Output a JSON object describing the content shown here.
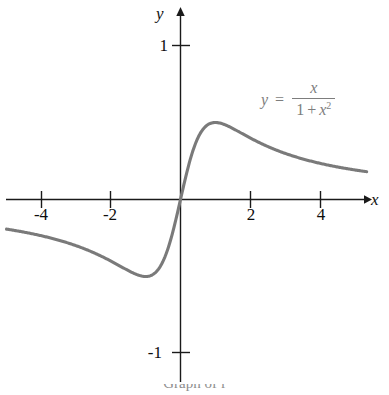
{
  "figure": {
    "background_color": "#ffffff",
    "curve_color": "#7a7a7a",
    "axis_color": "#1a1a1a",
    "label_color": "#0d0d0d",
    "equation_color": "#7d7d7d"
  },
  "axes": {
    "x_name": "x",
    "y_name": "y"
  },
  "equation": {
    "lhs": "y",
    "equals": "=",
    "numerator": "x",
    "denominator_one": "1",
    "denominator_plus": "+",
    "denominator_var": "x",
    "denominator_exp": "2",
    "plain": "y = x / (1 + x^2)"
  },
  "caption": {
    "text": "Graph of f "
  },
  "chart_data": {
    "type": "line",
    "title": "",
    "subtitle": "",
    "xlabel": "x",
    "ylabel": "y",
    "function": "y = x/(1 + x^2)",
    "legend": [
      "y = x/(1 + x^2)"
    ],
    "legend_position": "upper-right-inside",
    "grid": false,
    "xlim": [
      -5.0,
      5.35
    ],
    "ylim": [
      -1.3,
      1.26
    ],
    "xticks": [
      -4,
      -2,
      2,
      4
    ],
    "xtick_labels": [
      "-4",
      "-2",
      "2",
      "4"
    ],
    "yticks": [
      1,
      -1
    ],
    "ytick_labels": [
      "1",
      "-1"
    ],
    "annotations": [
      {
        "text": "local maximum",
        "x": 1,
        "y": 0.5
      },
      {
        "text": "local minimum",
        "x": -1,
        "y": -0.5
      }
    ],
    "series": [
      {
        "name": "y = x/(1 + x^2)",
        "color": "#7a7a7a",
        "linewidth": 3,
        "x": [
          -5.0,
          -4.6,
          -4.2,
          -3.8,
          -3.4,
          -3.0,
          -2.6,
          -2.2,
          -1.8,
          -1.4,
          -1.0,
          -0.8,
          -0.6,
          -0.4,
          -0.2,
          0.0,
          0.2,
          0.4,
          0.6,
          0.8,
          1.0,
          1.4,
          1.8,
          2.2,
          2.6,
          3.0,
          3.4,
          3.8,
          4.2,
          4.6,
          5.0,
          5.2
        ],
        "y": [
          -0.192,
          -0.207,
          -0.223,
          -0.242,
          -0.263,
          -0.3,
          -0.335,
          -0.373,
          -0.424,
          -0.473,
          -0.5,
          -0.488,
          -0.441,
          -0.345,
          -0.192,
          0.0,
          0.192,
          0.345,
          0.441,
          0.488,
          0.5,
          0.473,
          0.424,
          0.373,
          0.335,
          0.3,
          0.263,
          0.242,
          0.223,
          0.207,
          0.192,
          0.185
        ]
      }
    ]
  },
  "ticks": {
    "x": [
      {
        "label": "-4",
        "value": -4
      },
      {
        "label": "-2",
        "value": -2
      },
      {
        "label": "2",
        "value": 2
      },
      {
        "label": "4",
        "value": 4
      }
    ],
    "y": [
      {
        "label": "1",
        "value": 1
      },
      {
        "label": "-1",
        "value": -1
      }
    ]
  }
}
